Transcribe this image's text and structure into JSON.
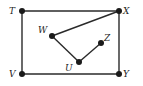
{
  "diagram": {
    "points": {
      "T": {
        "label": "T",
        "x": 22,
        "y": 11
      },
      "X": {
        "label": "X",
        "x": 119,
        "y": 11
      },
      "W": {
        "label": "W",
        "x": 52,
        "y": 36
      },
      "Z": {
        "label": "Z",
        "x": 101,
        "y": 43
      },
      "U": {
        "label": "U",
        "x": 79,
        "y": 62
      },
      "V": {
        "label": "V",
        "x": 22,
        "y": 74
      },
      "Y": {
        "label": "Y",
        "x": 119,
        "y": 74
      }
    },
    "segments": [
      [
        "T",
        "X"
      ],
      [
        "X",
        "Y"
      ],
      [
        "Y",
        "V"
      ],
      [
        "V",
        "T"
      ],
      [
        "X",
        "W"
      ],
      [
        "W",
        "U"
      ],
      [
        "U",
        "Z"
      ]
    ],
    "colors": {
      "stroke": "#2a2a2a",
      "dot": "#1a1a1a",
      "background": "#ffffff"
    }
  }
}
